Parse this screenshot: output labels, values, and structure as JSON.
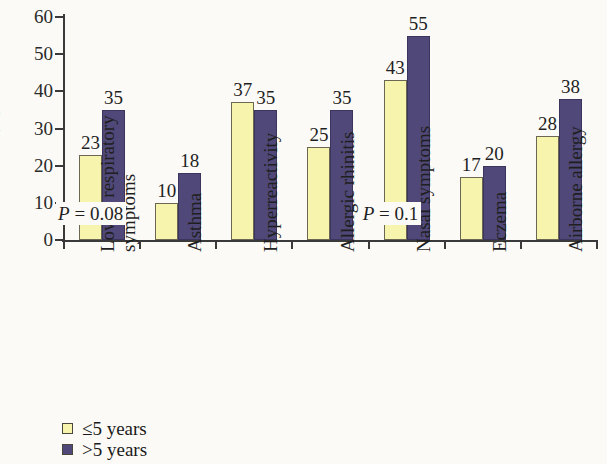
{
  "chart_data": {
    "type": "bar",
    "title": "",
    "xlabel": "",
    "ylabel": "(%)",
    "ylim": [
      0,
      60
    ],
    "yticks": [
      0,
      10,
      20,
      30,
      40,
      50,
      60
    ],
    "grid": false,
    "legend_position": "bottom-left",
    "categories": [
      "Lower respiratory symptoms",
      "Asthma",
      "Hyperreactivity",
      "Allergic rhinitis",
      "Nasal symptoms",
      "Eczema",
      "Airborne allergy"
    ],
    "category_lines": [
      [
        "Lower respiratory",
        "symptoms"
      ],
      [
        "Asthma"
      ],
      [
        "Hyperreactivity"
      ],
      [
        "Allergic rhinitis"
      ],
      [
        "Nasal symptoms"
      ],
      [
        "Eczema"
      ],
      [
        "Airborne allergy"
      ]
    ],
    "series": [
      {
        "name": "≤5 years",
        "color": "#f7f4ae",
        "values": [
          23,
          10,
          37,
          25,
          43,
          17,
          28
        ]
      },
      {
        "name": ">5 years",
        "color": "#4f4878",
        "values": [
          35,
          18,
          35,
          35,
          55,
          20,
          38
        ]
      }
    ],
    "annotations": [
      {
        "text_prefix": "P",
        "text_rest": " = 0.08",
        "category": "Lower respiratory symptoms",
        "value_y": 8
      },
      {
        "text_prefix": "P",
        "text_rest": " = 0.1",
        "category": "Nasal symptoms",
        "value_y": 8
      }
    ]
  },
  "legend": {
    "items": [
      {
        "label": "≤5 years",
        "color": "#f7f4ae"
      },
      {
        "label": ">5 years",
        "color": "#4f4878"
      }
    ]
  },
  "colors": {
    "series_1": "#f7f4ae",
    "series_2": "#4f4878",
    "axis": "#3a3a3a",
    "background": "#fbfaf6"
  }
}
